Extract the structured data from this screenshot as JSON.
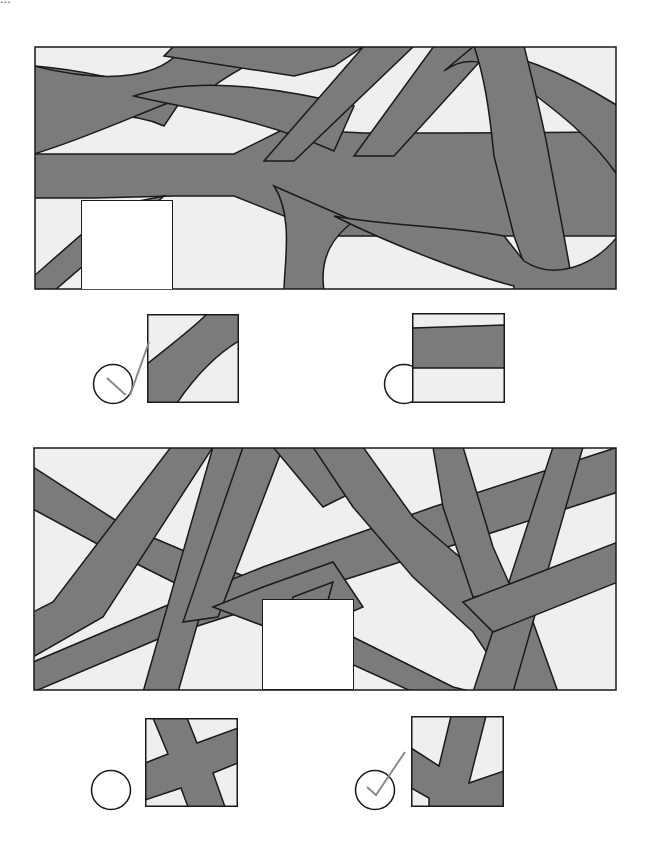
{
  "colors": {
    "band": "#7b7b7b",
    "background_fill": "#efefef",
    "outline": "#1a1a1a",
    "missing_piece": "#ffffff",
    "check_mark": "#8a8a8a"
  },
  "header": {
    "cut_off_text": "..."
  },
  "puzzles": [
    {
      "id": "puzzle-1",
      "missing_piece": "blank-square",
      "options": [
        {
          "id": "option-1a",
          "selected": true,
          "icon": "check-icon",
          "pattern": "diagonal-band"
        },
        {
          "id": "option-1b",
          "selected": false,
          "icon": "",
          "pattern": "horizontal-band"
        }
      ]
    },
    {
      "id": "puzzle-2",
      "missing_piece": "blank-square",
      "options": [
        {
          "id": "option-2a",
          "selected": false,
          "icon": "",
          "pattern": "crossing-bands"
        },
        {
          "id": "option-2b",
          "selected": true,
          "icon": "check-icon",
          "pattern": "branching-bands"
        }
      ]
    }
  ]
}
